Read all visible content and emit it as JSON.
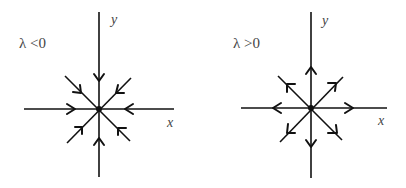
{
  "diagrams": [
    {
      "id": "sink",
      "condition_label": "λ <0",
      "x_axis_label": "x",
      "y_axis_label": "y",
      "flow_direction": "inward",
      "center": [
        99,
        109
      ]
    },
    {
      "id": "source",
      "condition_label": "λ >0",
      "x_axis_label": "x",
      "y_axis_label": "y",
      "flow_direction": "outward",
      "center": [
        311,
        108
      ]
    }
  ],
  "colors": {
    "stroke": "#111111",
    "label": "#444444",
    "background": "#ffffff"
  }
}
